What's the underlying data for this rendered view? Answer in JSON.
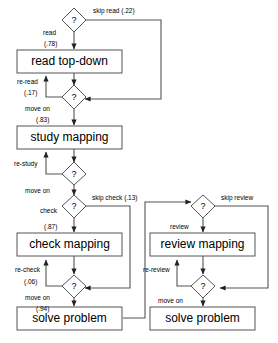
{
  "diagram": {
    "type": "flowchart"
  },
  "nodes": {
    "process": [
      {
        "id": "read-top-down",
        "label": "read top-down"
      },
      {
        "id": "study-mapping",
        "label": "study mapping"
      },
      {
        "id": "check-mapping",
        "label": "check mapping"
      },
      {
        "id": "solve-problem-left",
        "label": "solve problem"
      },
      {
        "id": "review-mapping",
        "label": "review mapping"
      },
      {
        "id": "solve-problem-right",
        "label": "solve problem"
      }
    ],
    "decision": [
      {
        "id": "decision-read",
        "label": "?"
      },
      {
        "id": "decision-reread",
        "label": "?"
      },
      {
        "id": "decision-restudy",
        "label": "?"
      },
      {
        "id": "decision-check",
        "label": "?"
      },
      {
        "id": "decision-recheck",
        "label": "?"
      },
      {
        "id": "decision-review",
        "label": "?"
      },
      {
        "id": "decision-rereview",
        "label": "?"
      }
    ]
  },
  "edges": {
    "skip_read": {
      "label": "skip read (.22)"
    },
    "read": {
      "label": "read"
    },
    "read_prob": {
      "label": "(.78)"
    },
    "re_read": {
      "label": "re-read"
    },
    "re_read_prob": {
      "label": "(.17)"
    },
    "move_on_1": {
      "label": "move on"
    },
    "move_on_1_prob": {
      "label": "(.83)"
    },
    "re_study": {
      "label": "re-study"
    },
    "move_on_2": {
      "label": "move on"
    },
    "skip_check": {
      "label": "skip check (.13)"
    },
    "check": {
      "label": "check"
    },
    "check_prob": {
      "label": "(.87)"
    },
    "re_check": {
      "label": "re-check"
    },
    "re_check_prob": {
      "label": "(.06)"
    },
    "move_on_3": {
      "label": "move on"
    },
    "move_on_3_prob": {
      "label": "(.94)"
    },
    "skip_review": {
      "label": "skip review"
    },
    "review": {
      "label": "review"
    },
    "re_review": {
      "label": "re-review"
    },
    "move_on_4": {
      "label": "move on"
    }
  },
  "colors": {
    "stroke": "#555555",
    "background": "#ffffff",
    "text": "#000000"
  }
}
